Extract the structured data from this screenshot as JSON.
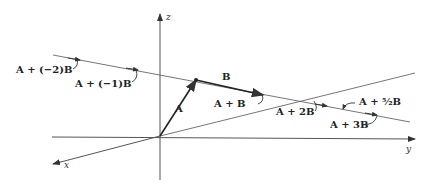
{
  "axes": {
    "z": "z",
    "y": "y",
    "x": "x"
  },
  "vectors": {
    "A": "A",
    "B": "B"
  },
  "labels": {
    "m2": "A + (−2)B",
    "m1": "A + (−1)B",
    "p1": "A + B",
    "p2": "A + 2B",
    "p52": "A + ⁵⁄₂B",
    "p3": "A + 3B"
  },
  "colors": {
    "line": "#555555",
    "vector": "#222222",
    "text": "#222222"
  }
}
